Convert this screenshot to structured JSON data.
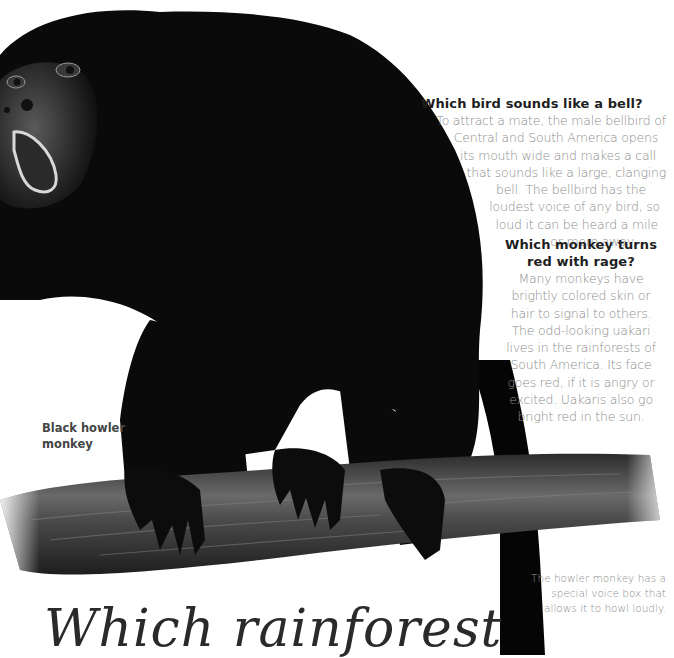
{
  "page": {
    "title": "Which rainforest"
  },
  "bell_question": {
    "heading": "Which bird sounds like a bell?",
    "lines": [
      "To attract a mate, the male bellbird of",
      "Central and South America opens",
      "its mouth wide and makes a call",
      "that sounds like a large, clanging",
      "bell. The bellbird has the",
      "loudest voice of any bird, so",
      "loud it can be heard a mile",
      "or more away."
    ]
  },
  "uakari_question": {
    "heading_lines": [
      "Which monkey turns",
      "red with rage?"
    ],
    "lines": [
      "Many monkeys have",
      "brightly colored skin or",
      "hair to signal to others.",
      "The odd-looking uakari",
      "lives in the rainforests of",
      "South America. Its face",
      "goes red, if it is angry or",
      "excited. Uakaris also go",
      "bright red in the sun."
    ]
  },
  "illustration": {
    "caption_lines": [
      "Black howler",
      "monkey"
    ],
    "subject": "black-howler-monkey-on-branch"
  },
  "voice_box_caption": {
    "lines": [
      "The howler monkey has a",
      "special voice box that",
      "allows it to howl loudly."
    ]
  },
  "colors": {
    "background": "#ffffff",
    "fur": "#0a0a0a",
    "branch": "#3a3a3a",
    "heading_text": "#1e1e1e",
    "body_text": "#8c8c8c"
  }
}
